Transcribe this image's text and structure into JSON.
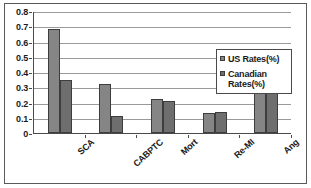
{
  "chart_data": {
    "type": "bar",
    "title": "",
    "xlabel": "",
    "ylabel": "",
    "categories": [
      "SCA",
      "CABPTC",
      "Mort",
      "Re-MI",
      "Ang"
    ],
    "series": [
      {
        "name": "US Rates(%)",
        "color": "#858585",
        "values": [
          0.68,
          0.32,
          0.22,
          0.13,
          0.27
        ]
      },
      {
        "name": "Canadian Rates(%)",
        "color": "#6e6e6e",
        "values": [
          0.35,
          0.11,
          0.21,
          0.14,
          0.33
        ]
      }
    ],
    "ylim": [
      0,
      0.8
    ],
    "ytick_labels": [
      "0.8",
      "0.7",
      "0.6",
      "0.5",
      "0.4",
      "0.3",
      "0.2",
      "0.1",
      "0"
    ],
    "ytick_values": [
      0.8,
      0.7,
      0.6,
      0.5,
      0.4,
      0.3,
      0.2,
      0.1,
      0
    ],
    "grid": true,
    "legend_position": "right"
  },
  "legend": {
    "entries": [
      {
        "label": "US Rates(%)"
      },
      {
        "label": "Canadian Rates(%)"
      }
    ]
  }
}
